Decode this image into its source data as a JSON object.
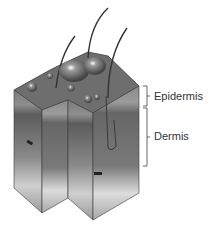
{
  "figure": {
    "labels": [
      {
        "text": "Epidermis",
        "bracket_top": 86,
        "bracket_bottom": 106
      },
      {
        "text": "Dermis",
        "bracket_top": 108,
        "bracket_bottom": 166
      }
    ]
  },
  "colors": {
    "surface": "#6e6e6e",
    "epidermis": "#8a8a8a",
    "dermis_dark": "#5e5e5e",
    "dermis_light": "#b8b8b8",
    "fat": "#e4e4e4",
    "outline": "#3a3a3a",
    "label_text": "#333333"
  }
}
